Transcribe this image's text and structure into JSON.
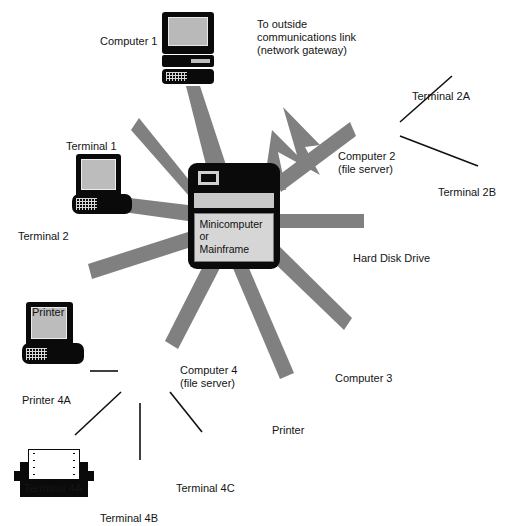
{
  "diagram": {
    "colors": {
      "background": "#ffffff",
      "icon_dark": "#0a0a0a",
      "screen_gray": "#bcbcbc",
      "link_gray": "#808080",
      "panel_gray": "#d6d6d6",
      "text": "#141414"
    }
  },
  "hub": {
    "name": "mainframe-hub",
    "panel_text": "Minicomputer\nor\nMainframe"
  },
  "gateway": {
    "name": "network-gateway-arrow",
    "caption": "To outside\ncommunications link\n(network gateway)",
    "caption_lines": [
      "To outside",
      "communications link",
      "(network gateway)"
    ]
  },
  "nodes": [
    {
      "id": "computer-1",
      "type": "computer",
      "label": "Computer 1",
      "x": 162,
      "y": 12,
      "w": 52,
      "h": 72,
      "label_x": 100,
      "label_y": 36,
      "label_align": "right"
    },
    {
      "id": "terminal-1",
      "type": "terminal",
      "label": "Terminal 1",
      "x": 72,
      "y": 82,
      "w": 60,
      "h": 60,
      "label_x": 68,
      "label_y": 139,
      "label_align": "left"
    },
    {
      "id": "terminal-2",
      "type": "terminal",
      "label": "Terminal 2",
      "x": 22,
      "y": 170,
      "w": 62,
      "h": 62,
      "label_x": 20,
      "label_y": 228,
      "label_align": "left"
    },
    {
      "id": "printer-hub",
      "type": "printer",
      "label": "Printer",
      "x": 14,
      "y": 253,
      "w": 80,
      "h": 50,
      "label_x": 34,
      "label_y": 306,
      "label_align": "left"
    },
    {
      "id": "printer-4a",
      "type": "printer",
      "label": "Printer 4A",
      "x": 10,
      "y": 340,
      "w": 84,
      "h": 52,
      "label_x": 24,
      "label_y": 394,
      "label_align": "left"
    },
    {
      "id": "computer-4",
      "type": "computer",
      "label": "Computer 4\n(file server)",
      "x": 118,
      "y": 336,
      "w": 58,
      "h": 76,
      "label_x": 180,
      "label_y": 368,
      "label_align": "left"
    },
    {
      "id": "terminal-4a",
      "type": "terminal",
      "label": "Terminal 4A",
      "x": 30,
      "y": 420,
      "w": 62,
      "h": 62,
      "label_x": 26,
      "label_y": 483,
      "label_align": "left"
    },
    {
      "id": "terminal-4b",
      "type": "terminal",
      "label": "Terminal 4B",
      "x": 105,
      "y": 452,
      "w": 62,
      "h": 62,
      "label_x": 102,
      "label_y": 512,
      "label_align": "left"
    },
    {
      "id": "terminal-4c",
      "type": "terminal",
      "label": "Terminal 4C",
      "x": 180,
      "y": 422,
      "w": 62,
      "h": 62,
      "label_x": 178,
      "label_y": 483,
      "label_align": "left"
    },
    {
      "id": "printer-lr",
      "type": "printer",
      "label": "Printer",
      "x": 253,
      "y": 370,
      "w": 82,
      "h": 52,
      "label_x": 274,
      "label_y": 424,
      "label_align": "left"
    },
    {
      "id": "computer-3",
      "type": "computer",
      "label": "Computer 3",
      "x": 345,
      "y": 298,
      "w": 52,
      "h": 72,
      "label_x": 337,
      "label_y": 372,
      "label_align": "left"
    },
    {
      "id": "hard-disk",
      "type": "hdd",
      "label": "Hard Disk Drive",
      "x": 358,
      "y": 200,
      "w": 80,
      "h": 48,
      "label_x": 355,
      "label_y": 251,
      "label_align": "left"
    },
    {
      "id": "computer-2",
      "type": "computer",
      "label": "Computer 2\n(file server)",
      "x": 348,
      "y": 76,
      "w": 52,
      "h": 72,
      "label_x": 340,
      "label_y": 152,
      "label_align": "left"
    },
    {
      "id": "terminal-2a",
      "type": "terminal",
      "label": "Terminal 2A",
      "x": 435,
      "y": 30,
      "w": 58,
      "h": 58,
      "label_x": 414,
      "label_y": 90,
      "label_align": "left"
    },
    {
      "id": "terminal-2b",
      "type": "terminal",
      "label": "Terminal 2B",
      "x": 464,
      "y": 127,
      "w": 56,
      "h": 56,
      "label_x": 440,
      "label_y": 186,
      "label_align": "left"
    }
  ],
  "links": {
    "hub_spokes": [
      {
        "to": "computer-1",
        "style": "thick-gray"
      },
      {
        "to": "terminal-1",
        "style": "thick-gray"
      },
      {
        "to": "terminal-2",
        "style": "thick-gray"
      },
      {
        "to": "printer-hub",
        "style": "thick-gray"
      },
      {
        "to": "computer-4",
        "style": "thick-gray"
      },
      {
        "to": "printer-lr",
        "style": "thick-gray"
      },
      {
        "to": "computer-3",
        "style": "thick-gray"
      },
      {
        "to": "hard-disk",
        "style": "thick-gray"
      },
      {
        "to": "computer-2",
        "style": "thick-gray"
      },
      {
        "to": "gateway",
        "style": "thick-gray-arrow"
      }
    ],
    "server_links": [
      {
        "from": "computer-2",
        "to": "terminal-2a",
        "style": "thin-black"
      },
      {
        "from": "computer-2",
        "to": "terminal-2b",
        "style": "thin-black"
      },
      {
        "from": "computer-4",
        "to": "printer-4a",
        "style": "thin-black"
      },
      {
        "from": "computer-4",
        "to": "terminal-4a",
        "style": "thin-black"
      },
      {
        "from": "computer-4",
        "to": "terminal-4b",
        "style": "thin-black"
      },
      {
        "from": "computer-4",
        "to": "terminal-4c",
        "style": "thin-black"
      }
    ]
  }
}
